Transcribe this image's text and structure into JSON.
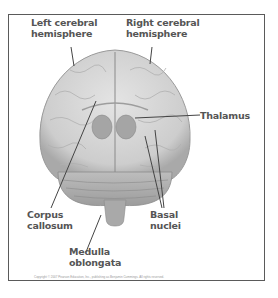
{
  "diagram": {
    "labels": {
      "left_hemisphere": [
        "Left cerebral",
        "hemisphere"
      ],
      "right_hemisphere": [
        "Right cerebral",
        "hemisphere"
      ],
      "thalamus": [
        "Thalamus"
      ],
      "corpus_callosum": [
        "Corpus",
        "callosum"
      ],
      "basal_nuclei": [
        "Basal",
        "nuclei"
      ],
      "medulla_oblongata": [
        "Medulla",
        "oblongata"
      ]
    },
    "copyright": "Copyright © 2007 Pearson Education, Inc., publishing as Benjamin Cummings. All rights reserved."
  },
  "colors": {
    "frame": "#5a5a5a",
    "brain_fill": "#d6d6d6",
    "brain_shadow": "#a8a8a8",
    "label_text": "#555555",
    "leader_line": "#444444"
  }
}
